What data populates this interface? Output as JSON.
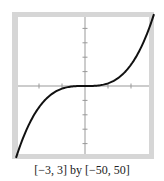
{
  "chart_data": {
    "type": "line",
    "title": "",
    "xlabel": "",
    "ylabel": "",
    "xlim": [
      -3,
      3
    ],
    "ylim": [
      -50,
      50
    ],
    "x_tick_step": 1,
    "y_tick_step": 10,
    "grid": false,
    "legend": null,
    "series": [
      {
        "name": "f(x)",
        "function_approx": "cubic, y ≈ 1.85x^3",
        "x": [
          -3,
          -2.5,
          -2,
          -1.5,
          -1,
          -0.5,
          0,
          0.5,
          1,
          1.5,
          2,
          2.5,
          3
        ],
        "y": [
          -50,
          -29,
          -15,
          -6,
          -2,
          -0.2,
          0,
          0.2,
          2,
          6,
          15,
          29,
          50
        ]
      }
    ],
    "caption": "[−3, 3] by [−50, 50]"
  },
  "caption": "[−3, 3] by [−50, 50]",
  "colors": {
    "frame": "#d6d6d6",
    "curve": "#111111",
    "axes": "#999999"
  }
}
